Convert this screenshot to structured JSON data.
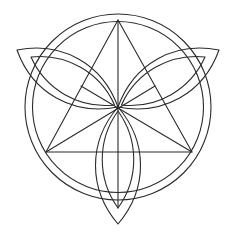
{
  "diagram": {
    "title": "Triquetra with circle and triangle construction",
    "background": "#ffffff",
    "stroke_color": "#2b2b2b",
    "stroke_width": 1.1,
    "center": [
      118,
      107
    ],
    "circle": {
      "cx": 118,
      "cy": 107,
      "outer_r": 93,
      "inner_r": 85.5
    },
    "triangle": {
      "vertices": [
        [
          118,
          20
        ],
        [
          46,
          152
        ],
        [
          192,
          152
        ]
      ]
    },
    "construction_lines": [
      {
        "name": "vertical-median",
        "from": [
          118,
          20
        ],
        "to": [
          118,
          208
        ]
      },
      {
        "name": "left-median",
        "from": [
          46,
          152
        ],
        "to": [
          155,
          86
        ]
      },
      {
        "name": "right-median",
        "from": [
          192,
          152
        ],
        "to": [
          81,
          86
        ]
      }
    ],
    "loops": [
      {
        "name": "left-loop",
        "outer_path": "M118,107 C92,72 45,48 17,50 C30,75 75,104 118,107",
        "inner_path": "M114,104 C92,82 55,62 31,56 C48,78 82,98 114,104",
        "outer_path_2": "M118,107 C100,88 72,58 17,50",
        "inner_path_2": "M118,107 C86,110 40,80 17,50"
      },
      {
        "name": "right-loop",
        "outer_path": "M118,107 C144,72 191,46 219,46 C206,74 161,104 118,107",
        "inner_path": "M122,104 C144,82 181,60 205,55 C188,78 154,98 122,104"
      },
      {
        "name": "bottom-loop",
        "outer_path": "M118,107 C90,140 92,190 118,224 C144,190 146,140 118,107",
        "inner_path": "M118,112 C98,142 100,182 118,208 C136,182 138,142 118,112"
      }
    ]
  }
}
